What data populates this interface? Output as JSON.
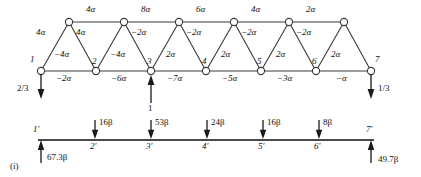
{
  "figure": {
    "tag": "(i)"
  },
  "truss": {
    "top_chord_labels": [
      "4α",
      "8α",
      "6α",
      "4α",
      "2α"
    ],
    "bottom_chord_labels": [
      "−2α",
      "−6α",
      "−7α",
      "−5α",
      "−3α",
      "−α"
    ],
    "diagonal_labels": [
      "4α",
      "4α",
      "−4α",
      "−4α",
      "−2α",
      "2α",
      "−2α",
      "2α",
      "−2α",
      "2α",
      "−2α",
      "2α",
      "−2α",
      "2α"
    ],
    "bottom_node_labels": [
      "1",
      "2",
      "3",
      "4",
      "5",
      "6",
      "7"
    ],
    "loads": [
      {
        "label": "2/3",
        "node": "1",
        "direction": "down"
      },
      {
        "label": "1",
        "node": "3",
        "direction": "up"
      },
      {
        "label": "1/3",
        "node": "7",
        "direction": "down"
      }
    ]
  },
  "beam": {
    "node_labels": [
      "1′",
      "2′",
      "3′",
      "4′",
      "5′",
      "6′",
      "7′"
    ],
    "point_loads": [
      {
        "node": "2′",
        "label": "16β",
        "direction": "down"
      },
      {
        "node": "3′",
        "label": "53β",
        "direction": "down"
      },
      {
        "node": "4′",
        "label": "24β",
        "direction": "down"
      },
      {
        "node": "5′",
        "label": "16β",
        "direction": "down"
      },
      {
        "node": "6′",
        "label": "8β",
        "direction": "down"
      }
    ],
    "reactions": [
      {
        "node": "1′",
        "label": "67.3β",
        "direction": "up"
      },
      {
        "node": "7′",
        "label": "49.7β",
        "direction": "up"
      }
    ]
  },
  "colors": {
    "line": "#333333",
    "text": "#111111",
    "background": "#ffffff"
  }
}
